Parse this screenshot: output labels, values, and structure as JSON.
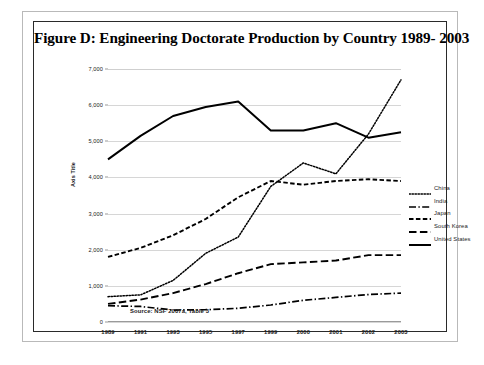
{
  "figure": {
    "title": "Figure D: Engineering Doctorate Production by Country 1989- 2003",
    "source_note": "Source: NSF 2007a, Table 3"
  },
  "chart_data": {
    "type": "line",
    "title": "Figure D: Engineering Doctorate Production by Country 1989- 2003",
    "xlabel": "",
    "ylabel": "Axis Title",
    "categories": [
      "1989",
      "1991",
      "1993",
      "1995",
      "1997",
      "1999",
      "2000",
      "2001",
      "2002",
      "2003"
    ],
    "ylim": [
      0,
      7000
    ],
    "yticks": [
      "0",
      "1,000",
      "2,000",
      "3,000",
      "4,000",
      "5,000",
      "6,000",
      "7,000"
    ],
    "ytick_values": [
      0,
      1000,
      2000,
      3000,
      4000,
      5000,
      6000,
      7000
    ],
    "grid": "horizontal",
    "legend_position": "right",
    "series": [
      {
        "name": "China",
        "style": "dotted",
        "color": "#000000",
        "values": [
          700,
          750,
          1150,
          1900,
          2350,
          3750,
          4400,
          4100,
          5200,
          6700
        ]
      },
      {
        "name": "India",
        "style": "dash-dot",
        "color": "#000000",
        "values": [
          450,
          430,
          330,
          340,
          380,
          470,
          600,
          680,
          760,
          800
        ]
      },
      {
        "name": "Japan",
        "style": "dashed",
        "color": "#000000",
        "values": [
          1800,
          2050,
          2400,
          2850,
          3450,
          3900,
          3800,
          3900,
          3950,
          3900
        ]
      },
      {
        "name": "South Korea",
        "style": "long-dash",
        "color": "#000000",
        "values": [
          500,
          620,
          800,
          1050,
          1350,
          1600,
          1650,
          1700,
          1850,
          1850
        ]
      },
      {
        "name": "United States",
        "style": "solid",
        "color": "#000000",
        "values": [
          4500,
          5150,
          5700,
          5950,
          6100,
          5300,
          5300,
          5500,
          5100,
          5250
        ]
      }
    ]
  }
}
